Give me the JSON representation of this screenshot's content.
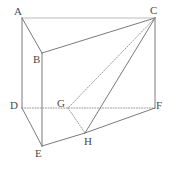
{
  "figure": {
    "type": "geometry-diagram",
    "background_color": "#ffffff",
    "stroke_colors": {
      "solid_dark": "#6b6b6b",
      "solid_light": "#b4b4b4",
      "dotted": "#8c8c8c"
    },
    "label_color": "#4a4a4a",
    "vertices": [
      {
        "id": "A",
        "label": "A",
        "x": 22,
        "y": 18,
        "label_x": 14,
        "label_y": 6
      },
      {
        "id": "B",
        "label": "B",
        "x": 42,
        "y": 53,
        "label_x": 33,
        "label_y": 54
      },
      {
        "id": "C",
        "label": "C",
        "x": 155,
        "y": 18,
        "label_x": 150,
        "label_y": 5
      },
      {
        "id": "D",
        "label": "D",
        "x": 22,
        "y": 108,
        "label_x": 10,
        "label_y": 100
      },
      {
        "id": "E",
        "label": "E",
        "x": 42,
        "y": 146,
        "label_x": 35,
        "label_y": 148
      },
      {
        "id": "F",
        "label": "F",
        "x": 155,
        "y": 108,
        "label_x": 156,
        "label_y": 100
      },
      {
        "id": "G",
        "label": "G",
        "x": 68,
        "y": 108,
        "label_x": 57,
        "label_y": 98
      },
      {
        "id": "H",
        "label": "H",
        "x": 85,
        "y": 133,
        "label_x": 84,
        "label_y": 136
      }
    ],
    "edges": [
      {
        "id": "AC",
        "from": "A",
        "to": "C",
        "style": "solid",
        "weight": "light"
      },
      {
        "id": "AB",
        "from": "A",
        "to": "B",
        "style": "solid",
        "weight": "dark"
      },
      {
        "id": "AD",
        "from": "A",
        "to": "D",
        "style": "solid",
        "weight": "dark"
      },
      {
        "id": "BC",
        "from": "B",
        "to": "C",
        "style": "solid",
        "weight": "dark"
      },
      {
        "id": "BE",
        "from": "B",
        "to": "E",
        "style": "solid",
        "weight": "dark"
      },
      {
        "id": "CF",
        "from": "C",
        "to": "F",
        "style": "solid",
        "weight": "dark"
      },
      {
        "id": "DE",
        "from": "D",
        "to": "E",
        "style": "solid",
        "weight": "dark"
      },
      {
        "id": "DF",
        "from": "D",
        "to": "F",
        "style": "dotted",
        "weight": "dotted"
      },
      {
        "id": "EH",
        "from": "E",
        "to": "H",
        "style": "solid",
        "weight": "dark"
      },
      {
        "id": "HF",
        "from": "H",
        "to": "F",
        "style": "solid",
        "weight": "dark"
      },
      {
        "id": "CH",
        "from": "C",
        "to": "H",
        "style": "solid",
        "weight": "dark"
      },
      {
        "id": "CG",
        "from": "C",
        "to": "G",
        "style": "dotted",
        "weight": "dotted"
      },
      {
        "id": "GH",
        "from": "G",
        "to": "H",
        "style": "dotted",
        "weight": "dotted"
      }
    ]
  }
}
